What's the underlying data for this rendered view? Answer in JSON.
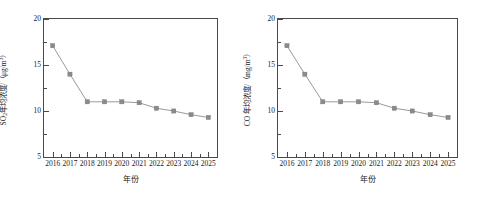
{
  "figure": {
    "background": "#ffffff",
    "frame_color": "#4a4a4a",
    "series_color": "#8a8a8a",
    "line_color": "#9a9a9a"
  },
  "panels": [
    {
      "id": "so2",
      "y_axis_title_main": "SO",
      "y_axis_title_sub": "2",
      "y_axis_title_rest": "年均浓度/（μg/m",
      "y_axis_title_sup": "3",
      "y_axis_title_close": "）",
      "x_axis_title": "年份"
    },
    {
      "id": "co",
      "y_axis_title_main": "CO",
      "y_axis_title_sub": "",
      "y_axis_title_rest": " 年均浓度/（mg/m",
      "y_axis_title_sup": "3",
      "y_axis_title_close": "）",
      "x_axis_title": "年份"
    }
  ],
  "chart_data": [
    {
      "type": "line",
      "title": "",
      "xlabel": "年份",
      "ylabel": "SO2年均浓度/（μg/m3）",
      "categories": [
        "2016",
        "2017",
        "2018",
        "2019",
        "2020",
        "2021",
        "2022",
        "2023",
        "2024",
        "2025"
      ],
      "x": [
        2016,
        2017,
        2018,
        2019,
        2020,
        2021,
        2022,
        2023,
        2024,
        2025
      ],
      "values": [
        17.1,
        14.0,
        11.0,
        11.0,
        11.0,
        10.9,
        10.3,
        10.0,
        9.6,
        9.3
      ],
      "ylim": [
        5,
        20
      ],
      "yticks": [
        5,
        10,
        15,
        20
      ],
      "ytick_labels": [
        "5",
        "10",
        "15",
        "20"
      ],
      "y_minor_ticks": [
        7.5,
        12.5,
        17.5
      ],
      "xlim": [
        2015.5,
        2025.5
      ],
      "grid": false,
      "legend": "none",
      "marker": "square",
      "marker_color": "#8a8a8a",
      "line_color": "#9a9a9a"
    },
    {
      "type": "line",
      "title": "",
      "xlabel": "年份",
      "ylabel": "CO年均浓度/（mg/m3）",
      "categories": [
        "2016",
        "2017",
        "2018",
        "2019",
        "2020",
        "2021",
        "2022",
        "2023",
        "2024",
        "2025"
      ],
      "x": [
        2016,
        2017,
        2018,
        2019,
        2020,
        2021,
        2022,
        2023,
        2024,
        2025
      ],
      "values": [
        17.1,
        14.0,
        11.0,
        11.0,
        11.0,
        10.9,
        10.3,
        10.0,
        9.6,
        9.3
      ],
      "ylim": [
        5,
        20
      ],
      "yticks": [
        5,
        10,
        15,
        20
      ],
      "ytick_labels": [
        "5",
        "10",
        "15",
        "20"
      ],
      "y_minor_ticks": [
        7.5,
        12.5,
        17.5
      ],
      "xlim": [
        2015.5,
        2025.5
      ],
      "grid": false,
      "legend": "none",
      "marker": "square",
      "marker_color": "#8a8a8a",
      "line_color": "#9a9a9a"
    }
  ]
}
